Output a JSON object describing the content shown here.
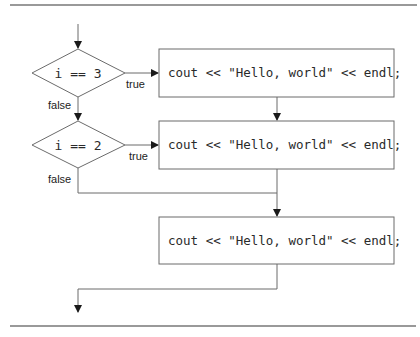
{
  "diagram": {
    "type": "flowchart",
    "decisions": [
      {
        "id": "d1",
        "condition": "i == 3",
        "true_label": "true",
        "false_label": "false"
      },
      {
        "id": "d2",
        "condition": "i == 2",
        "true_label": "true",
        "false_label": "false"
      }
    ],
    "statements": [
      {
        "id": "s1",
        "code": "cout << \"Hello, world\" << endl;"
      },
      {
        "id": "s2",
        "code": "cout << \"Hello, world\" << endl;"
      },
      {
        "id": "s3",
        "code": "cout << \"Hello, world\" << endl;"
      }
    ],
    "colors": {
      "stroke": "#6b6b6b",
      "text": "#2a2a2a",
      "background": "#ffffff"
    }
  }
}
